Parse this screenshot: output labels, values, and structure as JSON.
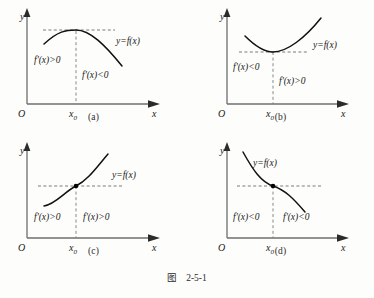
{
  "figure": {
    "caption_word": "图",
    "caption_number": "2-5-1"
  },
  "axis_labels": {
    "y": "y",
    "x": "x",
    "origin": "O",
    "x0": "x",
    "x0_sub": "0"
  },
  "panels": [
    {
      "id": "a",
      "caption": "(a)",
      "curve_label": "y=f(x)",
      "left_derivative": "f'(x)>0",
      "right_derivative": "f'(x)<0",
      "shape": "maximum",
      "has_point_dot": false
    },
    {
      "id": "b",
      "caption": "(b)",
      "curve_label": "y=f(x)",
      "left_derivative": "f'(x)<0",
      "right_derivative": "f'(x)>0",
      "shape": "minimum",
      "has_point_dot": false
    },
    {
      "id": "c",
      "caption": "(c)",
      "curve_label": "y=f(x)",
      "left_derivative": "f'(x)>0",
      "right_derivative": "f'(x)>0",
      "shape": "increasing-inflection",
      "has_point_dot": true
    },
    {
      "id": "d",
      "caption": "(d)",
      "curve_label": "y=f(x)",
      "left_derivative": "f'(x)<0",
      "right_derivative": "f'(x)<0",
      "shape": "decreasing-inflection",
      "has_point_dot": true
    }
  ],
  "colors": {
    "background": "#fdfdfb",
    "curve": "#111111",
    "axis": "#6e6e6e",
    "dash": "#6b6b6b",
    "text": "#1a1a1a"
  }
}
